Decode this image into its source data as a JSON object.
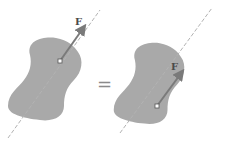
{
  "diagram": {
    "colors": {
      "body_fill": "#a9a9a9",
      "line_of_action": "#b3b3b3",
      "arrow": "#7a7a7a",
      "point_fill": "#ffffff",
      "point_stroke": "#555555",
      "equals": "#8a8a8a"
    },
    "left": {
      "force_label": "F",
      "application_point": [
        60,
        61
      ],
      "arrow_tip": [
        86,
        24
      ]
    },
    "right": {
      "force_label": "F",
      "application_point": [
        157,
        106
      ],
      "arrow_tip": [
        184,
        69
      ]
    },
    "operator": "="
  }
}
